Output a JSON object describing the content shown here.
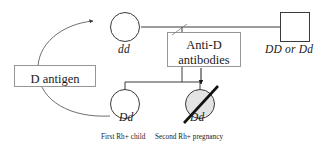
{
  "figure": {
    "type": "pedigree-diagram",
    "background_color": "#ffffff",
    "line_color": "#3a3a3a",
    "text_color": "#1a1a1a",
    "shaded_fill": "#e3e3e3"
  },
  "pedigree": {
    "mother": {
      "symbol": "circle",
      "sex": "female",
      "genotype": "dd",
      "affected": false
    },
    "father": {
      "symbol": "square",
      "sex": "male",
      "genotype": "DD or Dd",
      "affected": false
    },
    "children": [
      {
        "symbol": "circle",
        "sex": "female",
        "genotype": "Dd",
        "caption": "First Rh+ child",
        "shaded": false,
        "deceased": false
      },
      {
        "symbol": "circle",
        "sex": "female",
        "genotype": "Dd",
        "caption": "Second Rh+ pregnancy",
        "shaded": true,
        "deceased": true
      }
    ]
  },
  "annotations": {
    "d_antigen": {
      "label": "D antigen",
      "shape": "rectangle-callout"
    },
    "anti_d_antibodies": {
      "line1": "Anti-D",
      "line2": "antibodies",
      "shape": "rectangle-callout"
    }
  },
  "arrows": [
    {
      "name": "d-antigen-transfer-arrow",
      "from": "first-child",
      "to": "mother",
      "style": "curved"
    },
    {
      "name": "antibody-attack-arrow",
      "from": "anti-d-antibodies-box",
      "to": "second-child",
      "style": "straight-down"
    }
  ]
}
